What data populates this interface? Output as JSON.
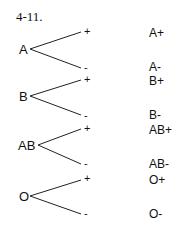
{
  "title": "4-11.",
  "groups": [
    {
      "root": "A",
      "plus": "+",
      "minus": "-"
    },
    {
      "root": "B",
      "plus": "+",
      "minus": "-"
    },
    {
      "root": "AB",
      "plus": "+",
      "minus": "-"
    },
    {
      "root": "O",
      "plus": "+",
      "minus": "-"
    }
  ],
  "outcomes": [
    "A+",
    "A-",
    "B+",
    "B-",
    "AB+",
    "AB-",
    "O+",
    "O-"
  ]
}
